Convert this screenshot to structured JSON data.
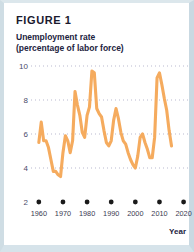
{
  "figure": {
    "label": "FIGURE 1",
    "title_line1": "Unemployment rate",
    "title_line2": "(percentage of labor force)"
  },
  "axis": {
    "y_ticks": [
      "10",
      "8",
      "6",
      "4",
      "2"
    ],
    "x_ticks": [
      "1960",
      "1970",
      "1980",
      "1990",
      "2000",
      "2010",
      "2020"
    ],
    "x_axis_title": "Year"
  },
  "colors": {
    "line": "#f5ab5e",
    "gridline": "#b9b9cf",
    "tick_dot": "#1a1a1a",
    "card_border": "#cfdde4",
    "text": "#1c2340"
  },
  "chart_data": {
    "type": "line",
    "title": "Unemployment rate (percentage of labor force)",
    "xlabel": "Year",
    "ylabel": "",
    "xlim": [
      1958,
      2021
    ],
    "ylim": [
      2,
      10.6
    ],
    "grid": true,
    "grid_values": [
      10,
      8,
      6,
      4
    ],
    "legend": "none",
    "series": [
      {
        "name": "Unemployment rate",
        "x": [
          1960,
          1961,
          1962,
          1963,
          1964,
          1965,
          1966,
          1967,
          1968,
          1969,
          1970,
          1971,
          1972,
          1973,
          1974,
          1975,
          1976,
          1977,
          1978,
          1979,
          1980,
          1981,
          1982,
          1983,
          1984,
          1985,
          1986,
          1987,
          1988,
          1989,
          1990,
          1991,
          1992,
          1993,
          1994,
          1995,
          1996,
          1997,
          1998,
          1999,
          2000,
          2001,
          2002,
          2003,
          2004,
          2005,
          2006,
          2007,
          2008,
          2009,
          2010,
          2011,
          2012,
          2013,
          2014,
          2015
        ],
        "values": [
          5.5,
          6.7,
          5.6,
          5.6,
          5.2,
          4.5,
          3.8,
          3.8,
          3.6,
          3.5,
          4.9,
          5.9,
          5.6,
          4.9,
          5.6,
          8.5,
          7.7,
          7.1,
          6.1,
          5.8,
          7.1,
          7.6,
          9.7,
          9.6,
          7.5,
          7.2,
          7.0,
          6.2,
          5.5,
          5.3,
          5.6,
          6.8,
          7.5,
          6.9,
          6.1,
          5.6,
          5.4,
          4.9,
          4.5,
          4.2,
          4.0,
          4.7,
          5.8,
          6.0,
          5.5,
          5.1,
          4.6,
          4.6,
          5.8,
          9.3,
          9.6,
          8.9,
          8.1,
          7.4,
          6.2,
          5.3
        ]
      }
    ],
    "annotations": [
      {
        "text": "peak 1982",
        "value": 9.7
      },
      {
        "text": "peak 2010",
        "value": 9.6
      },
      {
        "text": "trough 1969",
        "value": 3.5
      },
      {
        "text": "trough 2000",
        "value": 4.0
      }
    ]
  }
}
